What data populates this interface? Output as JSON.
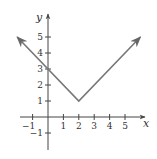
{
  "chart_data": {
    "type": "line",
    "title": "",
    "function": "y = |x - 2| + 1",
    "xlabel": "x",
    "ylabel": "y",
    "xlim": [
      -1.8,
      6.3
    ],
    "ylim": [
      -2.1,
      6.2
    ],
    "grid": false,
    "legend": null,
    "x_ticks": [
      -1,
      1,
      2,
      3,
      4,
      5
    ],
    "x_tick_labels": [
      "−1",
      "1",
      "2",
      "3",
      "4",
      "5"
    ],
    "y_ticks": [
      -1,
      1,
      2,
      3,
      4,
      5
    ],
    "y_tick_labels": [
      "−1",
      "1",
      "2",
      "3",
      "4",
      "5"
    ],
    "series": [
      {
        "name": "V-shaped graph",
        "points": [
          [
            -2,
            5
          ],
          [
            2,
            1
          ],
          [
            6,
            5
          ]
        ],
        "x": [
          -2,
          0,
          2,
          4,
          6
        ],
        "y": [
          5,
          3,
          1,
          3,
          5
        ],
        "arrows_both_ends": true,
        "color": "#777777"
      }
    ],
    "annotations": {
      "vertex": [
        2,
        1
      ],
      "y_intercept": [
        0,
        3
      ]
    }
  },
  "colors": {
    "axis": "#444444",
    "line": "#777777",
    "text": "#333333"
  }
}
